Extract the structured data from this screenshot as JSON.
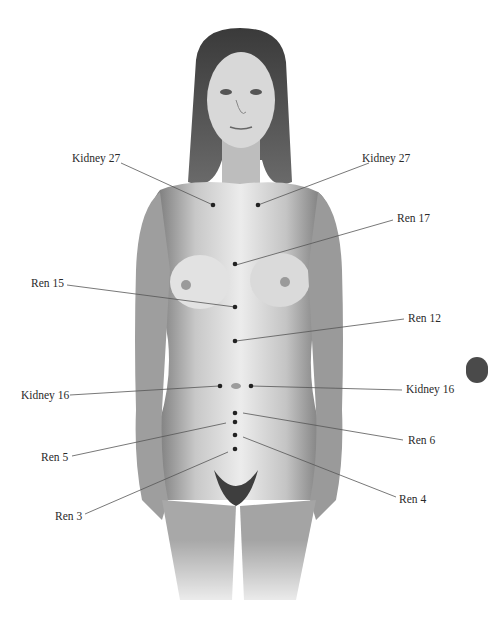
{
  "diagram": {
    "colors": {
      "background": "#ffffff",
      "line": "#555555",
      "point": "#222222",
      "text": "#2a2a2a"
    },
    "points": [
      {
        "id": "kidney-27-left",
        "label": "Kidney 27",
        "label_x": 72,
        "label_y": 153,
        "line": [
          121,
          163,
          213,
          205
        ],
        "point": [
          213,
          205
        ]
      },
      {
        "id": "kidney-27-right",
        "label": "Kidney 27",
        "label_x": 362,
        "label_y": 153,
        "line": [
          369,
          163,
          258,
          205
        ],
        "point": [
          258,
          205
        ]
      },
      {
        "id": "ren-17",
        "label": "Ren 17",
        "label_x": 397,
        "label_y": 213,
        "line": [
          393,
          220,
          236,
          265
        ],
        "point": [
          235,
          264
        ]
      },
      {
        "id": "ren-15",
        "label": "Ren 15",
        "label_x": 31,
        "label_y": 278,
        "line": [
          67,
          285,
          235,
          307
        ],
        "point": [
          235,
          307
        ]
      },
      {
        "id": "ren-12",
        "label": "Ren 12",
        "label_x": 408,
        "label_y": 313,
        "line": [
          404,
          319,
          236,
          341
        ],
        "point": [
          235,
          341
        ]
      },
      {
        "id": "kidney-16-left",
        "label": "Kidney 16",
        "label_x": 21,
        "label_y": 390,
        "line": [
          70,
          395,
          219,
          386
        ],
        "point": [
          220,
          386
        ]
      },
      {
        "id": "kidney-16-right",
        "label": "Kidney 16",
        "label_x": 406,
        "label_y": 384,
        "line": [
          402,
          390,
          251,
          386
        ],
        "point": [
          251,
          386
        ]
      },
      {
        "id": "ren-6",
        "label": "Ren 6",
        "label_x": 408,
        "label_y": 435,
        "line": [
          403,
          440,
          243,
          413
        ],
        "point": [
          235,
          413
        ]
      },
      {
        "id": "ren-5",
        "label": "Ren 5",
        "label_x": 41,
        "label_y": 452,
        "line": [
          72,
          456,
          226,
          423
        ],
        "point": [
          235,
          422
        ]
      },
      {
        "id": "ren-4",
        "label": "Ren 4",
        "label_x": 399,
        "label_y": 494,
        "line": [
          396,
          497,
          243,
          437
        ],
        "point": [
          235,
          435
        ]
      },
      {
        "id": "ren-3",
        "label": "Ren 3",
        "label_x": 55,
        "label_y": 511,
        "line": [
          85,
          514,
          228,
          452
        ],
        "point": [
          235,
          449
        ]
      }
    ]
  }
}
